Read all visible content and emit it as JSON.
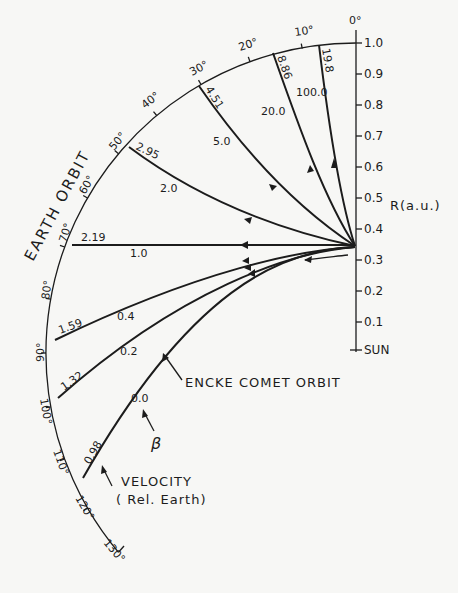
{
  "diagram": {
    "earth_orbit_label": "EARTH ORBIT",
    "axis": {
      "label": "R(a.u.)",
      "sun_label": "SUN",
      "ticks": [
        "1.0",
        "0.9",
        "0.8",
        "0.7",
        "0.6",
        "0.5",
        "0.4",
        "0.3",
        "0.2",
        "0.1"
      ]
    },
    "angle_ticks": [
      "0°",
      "10°",
      "20°",
      "30°",
      "40°",
      "50°",
      "60°",
      "70°",
      "80°",
      "90°",
      "100°",
      "110°",
      "120°",
      "130°"
    ],
    "trajectories": [
      {
        "beta": "100.0",
        "velocity": "19.8"
      },
      {
        "beta": "20.0",
        "velocity": "8.86"
      },
      {
        "beta": "5.0",
        "velocity": "4.51"
      },
      {
        "beta": "2.0",
        "velocity": "2.95"
      },
      {
        "beta": "1.0",
        "velocity": "2.19"
      },
      {
        "beta": "0.4",
        "velocity": "1.59"
      },
      {
        "beta": "0.2",
        "velocity": "1.32"
      },
      {
        "beta": "0.0",
        "velocity": "0.98"
      }
    ],
    "annotations": {
      "encke": "ENCKE COMET ORBIT",
      "beta_symbol": "β",
      "velocity_line1": "VELOCITY",
      "velocity_line2": "( Rel. Earth)"
    }
  }
}
